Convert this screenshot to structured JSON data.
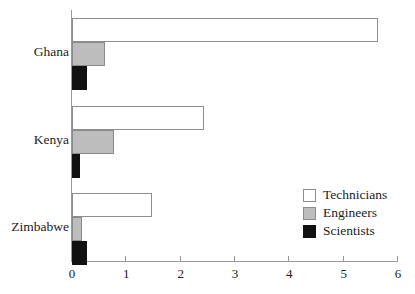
{
  "chart_data": {
    "type": "bar",
    "orientation": "horizontal",
    "title": "",
    "subtitle": "",
    "xlabel": "",
    "ylabel": "",
    "xlim": [
      0,
      6
    ],
    "ylim": null,
    "grid": false,
    "legend_position": "bottom-right",
    "categories": [
      "Ghana",
      "Kenya",
      "Zimbabwe"
    ],
    "tick_labels": [
      "0",
      "1",
      "2",
      "3",
      "4",
      "5",
      "6"
    ],
    "tick_values": [
      0,
      1,
      2,
      3,
      4,
      5,
      6
    ],
    "series": [
      {
        "name": "Technicians",
        "color": "#ffffff",
        "edge_color": "#8e8e8e",
        "values": [
          5.63,
          2.43,
          1.47
        ]
      },
      {
        "name": "Engineers",
        "color": "#bdbdbd",
        "edge_color": "#8a8a8a",
        "values": [
          0.61,
          0.77,
          0.19
        ]
      },
      {
        "name": "Scientists",
        "color": "#111111",
        "edge_color": "#111111",
        "values": [
          0.28,
          0.14,
          0.28
        ]
      }
    ],
    "points": [
      {
        "category": "Ghana",
        "series": "Technicians",
        "value": 5.63
      },
      {
        "category": "Ghana",
        "series": "Engineers",
        "value": 0.61
      },
      {
        "category": "Ghana",
        "series": "Scientists",
        "value": 0.28
      },
      {
        "category": "Kenya",
        "series": "Technicians",
        "value": 2.43
      },
      {
        "category": "Kenya",
        "series": "Engineers",
        "value": 0.77
      },
      {
        "category": "Kenya",
        "series": "Scientists",
        "value": 0.14
      },
      {
        "category": "Zimbabwe",
        "series": "Technicians",
        "value": 1.47
      },
      {
        "category": "Zimbabwe",
        "series": "Engineers",
        "value": 0.19
      },
      {
        "category": "Zimbabwe",
        "series": "Scientists",
        "value": 0.28
      }
    ]
  },
  "legend": {
    "items": [
      {
        "label": "Technicians",
        "swatch": "technicians"
      },
      {
        "label": "Engineers",
        "swatch": "engineers"
      },
      {
        "label": "Scientists",
        "swatch": "scientists"
      }
    ]
  },
  "layout": {
    "plot_left_px": 72,
    "plot_right_px": 398,
    "plot_top_px": 10,
    "axis_y_px": 261,
    "px_per_unit": 54.33,
    "group_tops_px": [
      18,
      106,
      193
    ],
    "bar_height_px": 24,
    "bar_gap_px": 0
  }
}
